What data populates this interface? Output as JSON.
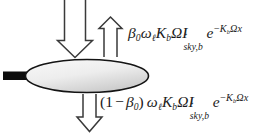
{
  "figure": {
    "background_color": "#ffffff",
    "stroke_color": "#1b1b1b"
  },
  "leaf": {
    "label": "leaf-ellipse",
    "fill_light": "#f2f2f2",
    "fill_dark": "#c9c9c9",
    "outline_color": "#141414",
    "petiole_color": "#0d0d0d"
  },
  "arrows": {
    "incident_down": {
      "name": "incident-radiation-arrow",
      "direction": "down",
      "style": "hollow-outline"
    },
    "reflected_up": {
      "name": "reflected-radiation-arrow",
      "direction": "up",
      "style": "hollow-outline"
    },
    "transmitted_down": {
      "name": "transmitted-radiation-arrow",
      "direction": "down",
      "style": "hollow-outline"
    }
  },
  "formulas": {
    "reflected": {
      "name": "reflected-flux-formula",
      "plain_text": "beta_0 omega_l K_b Omega I_sky,b^down e^(-K_b Omega x)",
      "parts": {
        "beta": "β",
        "beta_sub": "0",
        "omega": "ω",
        "omega_sub": "ℓ",
        "K": "K",
        "K_sub": "b",
        "Omega": "Ω",
        "I": "I",
        "I_sup_arrow": "↓",
        "I_sub": "sky,b",
        "e": "e",
        "exp_minus": "−",
        "exp_K": "K",
        "exp_K_sub": "b",
        "exp_Omega": "Ω",
        "exp_x": "x"
      }
    },
    "transmitted": {
      "name": "transmitted-flux-formula",
      "plain_text": "(1 - beta_0) omega_l K_b Omega I_sky,b^down e^(-K_b Omega x)",
      "parts": {
        "open_paren": "(",
        "one": "1",
        "minus": "−",
        "beta": "β",
        "beta_sub": "0",
        "close_paren": ")",
        "omega": "ω",
        "omega_sub": "ℓ",
        "K": "K",
        "K_sub": "b",
        "Omega": "Ω",
        "I": "I",
        "I_sup_arrow": "↓",
        "I_sub": "sky,b",
        "e": "e",
        "exp_minus": "−",
        "exp_K": "K",
        "exp_K_sub": "b",
        "exp_Omega": "Ω",
        "exp_x": "x"
      }
    }
  }
}
